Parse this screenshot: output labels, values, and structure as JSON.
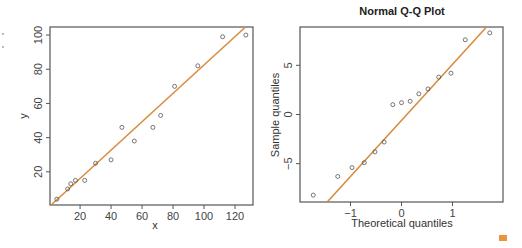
{
  "chart_data": [
    {
      "type": "scatter",
      "title": "",
      "xlabel": "x",
      "ylabel": "y",
      "xlim": [
        0.6,
        131.6
      ],
      "ylim": [
        0.6,
        104.7
      ],
      "xticks": [
        20,
        40,
        60,
        80,
        100,
        120
      ],
      "yticks": [
        20,
        40,
        60,
        80,
        100
      ],
      "grid": false,
      "points": [
        {
          "x": 5,
          "y": 4
        },
        {
          "x": 12,
          "y": 10
        },
        {
          "x": 14,
          "y": 13
        },
        {
          "x": 17,
          "y": 15
        },
        {
          "x": 23,
          "y": 15
        },
        {
          "x": 30,
          "y": 25
        },
        {
          "x": 40,
          "y": 27
        },
        {
          "x": 47,
          "y": 46
        },
        {
          "x": 55,
          "y": 38
        },
        {
          "x": 67,
          "y": 46
        },
        {
          "x": 72,
          "y": 53
        },
        {
          "x": 81,
          "y": 70
        },
        {
          "x": 96,
          "y": 82
        },
        {
          "x": 112,
          "y": 99
        },
        {
          "x": 127,
          "y": 100
        }
      ],
      "fit_line": {
        "slope": 0.83,
        "intercept": -0.5,
        "color": "#d98c3f"
      }
    },
    {
      "type": "scatter",
      "title": "Normal Q-Q Plot",
      "xlabel": "Theoretical quantiles",
      "ylabel": "Sample quantiles",
      "xlim": [
        -1.99,
        1.99
      ],
      "ylim": [
        -8.9,
        8.9
      ],
      "xticks": [
        -1,
        0,
        1
      ],
      "yticks": [
        -5,
        0,
        5
      ],
      "grid": false,
      "points": [
        {
          "x": -1.73,
          "y": -8.2
        },
        {
          "x": -1.25,
          "y": -6.3
        },
        {
          "x": -0.97,
          "y": -5.4
        },
        {
          "x": -0.73,
          "y": -4.9
        },
        {
          "x": -0.52,
          "y": -3.8
        },
        {
          "x": -0.34,
          "y": -2.8
        },
        {
          "x": -0.17,
          "y": 1.0
        },
        {
          "x": 0.0,
          "y": 1.2
        },
        {
          "x": 0.17,
          "y": 1.35
        },
        {
          "x": 0.34,
          "y": 2.1
        },
        {
          "x": 0.52,
          "y": 2.6
        },
        {
          "x": 0.73,
          "y": 3.8
        },
        {
          "x": 0.97,
          "y": 4.2
        },
        {
          "x": 1.25,
          "y": 7.6
        },
        {
          "x": 1.73,
          "y": 8.3
        }
      ],
      "fit_line": {
        "slope": 5.7,
        "intercept": -0.6,
        "color": "#d98c3f"
      }
    }
  ],
  "left_plot": {
    "xlabel": "x",
    "ylabel": "y",
    "xticks": [
      "20",
      "40",
      "60",
      "80",
      "100",
      "120"
    ],
    "yticks": [
      "20",
      "40",
      "60",
      "80",
      "100"
    ]
  },
  "right_plot": {
    "title": "Normal Q-Q Plot",
    "xlabel": "Theoretical quantiles",
    "ylabel": "Sample quantiles",
    "xticks": [
      "−1",
      "0",
      "1"
    ],
    "yticks": [
      "−5",
      "0",
      "5"
    ]
  },
  "colors": {
    "fit_line": "#d98c3f",
    "corner_mark": "#e8953f",
    "frame": "#555555"
  }
}
